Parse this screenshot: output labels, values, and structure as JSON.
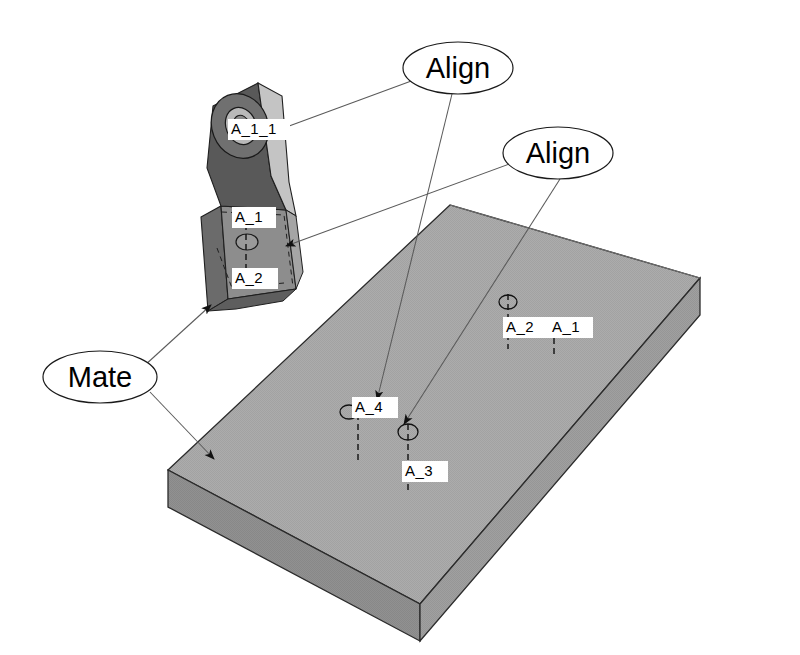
{
  "document": {
    "title": "Assembly Mating Constraints Illustration",
    "background_color": "#ffffff",
    "line_color": "#000000"
  },
  "colors": {
    "plate_top": "#a9a9a9",
    "plate_front": "#8e8e8e",
    "plate_right": "#9e9e9e",
    "bracket_dark": "#5a5a5a",
    "bracket_mid": "#8a8a8a",
    "bracket_light": "#c9c9c9",
    "leader": "#555555",
    "outline": "#1a1a1a",
    "label_bg": "#ffffff"
  },
  "callouts": [
    {
      "id": "callout-align-1",
      "label": "Align",
      "cx": 458,
      "cy": 68,
      "rx": 55,
      "ry": 26
    },
    {
      "id": "callout-align-2",
      "label": "Align",
      "cx": 558,
      "cy": 153,
      "rx": 55,
      "ry": 26
    },
    {
      "id": "callout-mate",
      "label": "Mate",
      "cx": 100,
      "cy": 377,
      "rx": 57,
      "ry": 26
    }
  ],
  "part_labels": [
    {
      "id": "label-bracket-a11",
      "text": "A_1_1",
      "x": 232,
      "y": 130,
      "part": "bracket"
    },
    {
      "id": "label-bracket-a1",
      "text": "A_1",
      "x": 236,
      "y": 218,
      "part": "bracket"
    },
    {
      "id": "label-bracket-a2",
      "text": "A_2",
      "x": 236,
      "y": 279,
      "part": "bracket"
    },
    {
      "id": "label-plate-a2",
      "text": "A_2",
      "x": 507,
      "y": 328,
      "part": "plate"
    },
    {
      "id": "label-plate-a1",
      "text": "A_1",
      "x": 553,
      "y": 328,
      "part": "plate"
    },
    {
      "id": "label-plate-a4",
      "text": "A_4",
      "x": 356,
      "y": 408,
      "part": "plate"
    },
    {
      "id": "label-plate-a3",
      "text": "A_3",
      "x": 406,
      "y": 472,
      "part": "plate"
    }
  ],
  "axes": [
    {
      "id": "axis-plate-a2",
      "cx": 508,
      "cy": 302,
      "top": 294,
      "bottom": 349
    },
    {
      "id": "axis-plate-a1",
      "cx": 554,
      "cy": 302,
      "top": 318,
      "bottom": 358
    },
    {
      "id": "axis-plate-a4",
      "cx": 358,
      "cy": 412,
      "top": 404,
      "bottom": 463
    },
    {
      "id": "axis-plate-a3",
      "cx": 408,
      "cy": 432,
      "top": 424,
      "bottom": 492
    },
    {
      "id": "axis-bracket-a1",
      "cx": 246,
      "cy": 240,
      "top": 212,
      "bottom": 284
    }
  ],
  "leaders": {
    "align_1": [
      {
        "from": [
          414,
          80
        ],
        "to": [
          258,
          138
        ]
      },
      {
        "from": [
          452,
          94
        ],
        "to": [
          378,
          404
        ]
      }
    ],
    "align_2": [
      {
        "from": [
          512,
          163
        ],
        "to": [
          282,
          248
        ]
      },
      {
        "from": [
          560,
          179
        ],
        "to": [
          403,
          428
        ]
      }
    ],
    "mate": [
      {
        "from": [
          144,
          366
        ],
        "to": [
          213,
          303
        ]
      },
      {
        "from": [
          150,
          392
        ],
        "to": [
          216,
          462
        ]
      }
    ]
  },
  "geometry": {
    "plate": {
      "top_face": "168,470 450,205 700,278 420,604",
      "front_face": "168,470 420,604 420,641 168,507",
      "right_face": "420,604 700,278 700,315 420,641",
      "description": "Rectangular base plate in isometric view"
    },
    "bracket": {
      "description": "L-shaped bracket with cylindrical boss, shown exploded above the plate"
    }
  },
  "arrows": [
    {
      "id": "arrow-mate-target",
      "x": 216,
      "y": 462,
      "angle": 115
    },
    {
      "id": "arrow-align1-bracket",
      "x": 258,
      "y": 138,
      "angle": 200
    },
    {
      "id": "arrow-align1-plate",
      "x": 378,
      "y": 404,
      "angle": 100
    },
    {
      "id": "arrow-align2-bracket",
      "x": 282,
      "y": 248,
      "angle": 205
    },
    {
      "id": "arrow-align2-plate",
      "x": 403,
      "y": 428,
      "angle": 98
    }
  ]
}
